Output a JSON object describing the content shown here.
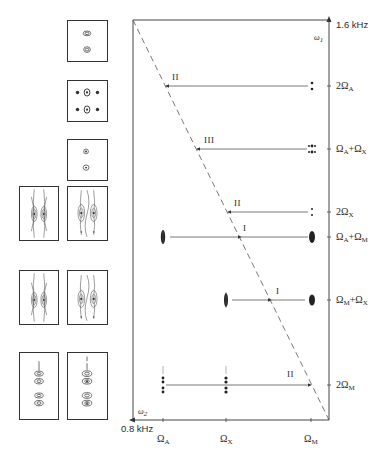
{
  "figure": {
    "type": "2D NMR spectrum schematic (double-quantum)",
    "axes": {
      "y_axis_symbol": "ω",
      "y_axis_sub": "1",
      "y_top_label": "1.6 kHz",
      "x_axis_symbol": "ω",
      "x_axis_sub": "2",
      "x_left_label": "0.8 kHz"
    },
    "x_ticks": [
      {
        "sym": "Ω",
        "sub": "A"
      },
      {
        "sym": "Ω",
        "sub": "X"
      },
      {
        "sym": "Ω",
        "sub": "M"
      }
    ],
    "y_ticks": [
      {
        "pre": "2Ω",
        "sub": "A",
        "post": "",
        "sub2": ""
      },
      {
        "pre": "Ω",
        "sub": "A",
        "post": "+Ω",
        "sub2": "X"
      },
      {
        "pre": "2Ω",
        "sub": "X",
        "post": "",
        "sub2": ""
      },
      {
        "pre": "Ω",
        "sub": "A",
        "post": "+Ω",
        "sub2": "M"
      },
      {
        "pre": "Ω",
        "sub": "M",
        "post": "+Ω",
        "sub2": "X"
      },
      {
        "pre": "2Ω",
        "sub": "M",
        "post": "",
        "sub2": ""
      }
    ],
    "transitions": [
      {
        "label": "II"
      },
      {
        "label": "III"
      },
      {
        "label": "II"
      },
      {
        "label": "I"
      },
      {
        "label": "I"
      },
      {
        "label": "II"
      }
    ]
  }
}
